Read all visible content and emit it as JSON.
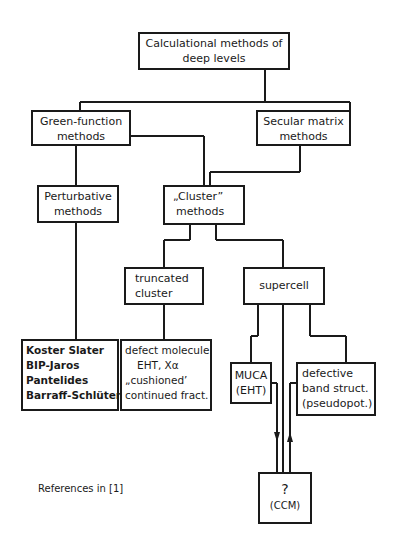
{
  "diagram": {
    "title_box": {
      "line1": "Calculational methods of",
      "line2": "deep levels"
    },
    "green_function": {
      "line1": "Green-function",
      "line2": "methods"
    },
    "secular_matrix": {
      "line1": "Secular matrix",
      "line2": "methods"
    },
    "perturbative": {
      "line1": "Perturbative",
      "line2": "methods"
    },
    "cluster": {
      "line1": "„Cluster”",
      "line2": "methods"
    },
    "truncated_cluster": {
      "line1": "truncated",
      "line2": "cluster"
    },
    "supercell": {
      "line1": "supercell"
    },
    "perturbative_refs": {
      "items": [
        "Koster Slater",
        "BIP-Jaros",
        "Pantelides",
        "Barraff-Schlüter"
      ]
    },
    "truncated_refs": {
      "items": [
        "defect molecule",
        "EHT, Xα",
        "„cushioned’",
        "continued fract."
      ]
    },
    "muca": {
      "line1": "MUCA",
      "line2": "(EHT)"
    },
    "defective_band": {
      "line1": "defective",
      "line2": "band struct.",
      "line3": "(pseudopot.)"
    },
    "ccm": {
      "line1": "?",
      "line2": "(CCM)"
    },
    "footnote": "References in [1]"
  }
}
